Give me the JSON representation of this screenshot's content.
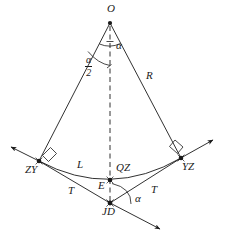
{
  "figure": {
    "kind": "circular-curve-geometry-diagram",
    "background_color": "#ffffff",
    "stroke_color": "#1a1a1a",
    "width": 227,
    "height": 245
  },
  "points": [
    {
      "id": "O",
      "label": "O",
      "x": 110,
      "y": 23,
      "label_x": 107,
      "label_y": 4,
      "marker": "dot"
    },
    {
      "id": "ZY",
      "label": "ZY",
      "x": 39,
      "y": 161,
      "label_x": 25,
      "label_y": 166,
      "marker": "dot-cross"
    },
    {
      "id": "YZ",
      "label": "YZ",
      "x": 181,
      "y": 158,
      "label_x": 181,
      "label_y": 163,
      "marker": "dot-cross"
    },
    {
      "id": "E",
      "label": "E",
      "x": 110,
      "y": 180,
      "label_x": 99,
      "label_y": 182,
      "marker": "dot-cross"
    },
    {
      "id": "JD",
      "label": "JD",
      "x": 110,
      "y": 203,
      "label_x": 103,
      "label_y": 208,
      "marker": "dot-cross"
    },
    {
      "id": "QZ",
      "label": "QZ",
      "x": 126,
      "y": 170,
      "label_x": 117,
      "label_y": 166,
      "marker": "none"
    }
  ],
  "segment_labels": [
    {
      "id": "R",
      "label": "R",
      "x": 148,
      "y": 76
    },
    {
      "id": "L",
      "label": "L",
      "x": 78,
      "y": 165
    },
    {
      "id": "T-left",
      "label": "T",
      "x": 69,
      "y": 189
    },
    {
      "id": "T-right",
      "label": "T",
      "x": 152,
      "y": 188
    }
  ],
  "angle_labels": [
    {
      "id": "alpha-apex",
      "label": "α",
      "x": 117,
      "y": 45
    },
    {
      "id": "alpha-jd",
      "label": "α",
      "x": 136,
      "y": 198
    }
  ],
  "fraction_labels": [
    {
      "id": "alpha-over-2",
      "numerator": "α",
      "denominator": "2",
      "x": 91,
      "y": 63
    }
  ],
  "geometry": {
    "center": {
      "x": 110,
      "y": 23
    },
    "radius": 141,
    "tangent_point_left": {
      "x": 39,
      "y": 161
    },
    "tangent_point_right": {
      "x": 181,
      "y": 158
    },
    "arc_midpoint": {
      "x": 110,
      "y": 180
    },
    "intersection_point": {
      "x": 110,
      "y": 203
    },
    "bisector_is_dashed": true,
    "right_angle_markers": [
      {
        "at": "ZY",
        "x": 48,
        "y": 152
      },
      {
        "at": "YZ",
        "x": 172,
        "y": 149
      }
    ],
    "arrow_heads": [
      {
        "from": "ZY",
        "to_x": 8,
        "to_y": 146
      },
      {
        "from": "YZ",
        "to_x": 216,
        "to_y": 142
      },
      {
        "from": "JD",
        "to_x": 163,
        "to_y": 231
      }
    ]
  }
}
